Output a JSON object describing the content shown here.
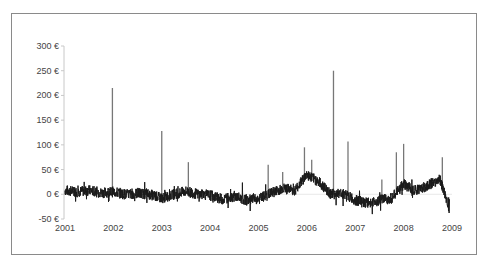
{
  "chart_data": {
    "type": "line",
    "title": "",
    "xlabel": "",
    "ylabel": "",
    "currency_suffix": " €",
    "ylim": [
      -50,
      300
    ],
    "yticks": [
      -50,
      0,
      50,
      100,
      150,
      200,
      250,
      300
    ],
    "ytick_labels": [
      "-50 €",
      "0 €",
      "50 €",
      "100 €",
      "150 €",
      "200 €",
      "250 €",
      "300 €"
    ],
    "xlim": [
      2001,
      2009
    ],
    "xticks": [
      2001,
      2002,
      2003,
      2004,
      2005,
      2006,
      2007,
      2008,
      2009
    ],
    "xtick_labels": [
      "2001",
      "2002",
      "2003",
      "2004",
      "2005",
      "2006",
      "2007",
      "2008",
      "2009"
    ],
    "grid": false,
    "legend": null,
    "line_color": "#1a1a1a",
    "spike_color": "#777777",
    "series": [
      {
        "name": "price",
        "baseline": [
          [
            2001.0,
            8
          ],
          [
            2001.25,
            5
          ],
          [
            2001.5,
            8
          ],
          [
            2001.75,
            3
          ],
          [
            2002.0,
            5
          ],
          [
            2002.25,
            0
          ],
          [
            2002.5,
            2
          ],
          [
            2002.75,
            0
          ],
          [
            2003.0,
            -8
          ],
          [
            2003.25,
            0
          ],
          [
            2003.5,
            6
          ],
          [
            2003.75,
            0
          ],
          [
            2004.0,
            -2
          ],
          [
            2004.25,
            -10
          ],
          [
            2004.5,
            -4
          ],
          [
            2004.75,
            -12
          ],
          [
            2005.0,
            -10
          ],
          [
            2005.25,
            2
          ],
          [
            2005.5,
            12
          ],
          [
            2005.75,
            8
          ],
          [
            2006.0,
            40
          ],
          [
            2006.25,
            25
          ],
          [
            2006.5,
            0
          ],
          [
            2006.75,
            2
          ],
          [
            2007.0,
            -12
          ],
          [
            2007.25,
            -18
          ],
          [
            2007.5,
            -12
          ],
          [
            2007.75,
            -8
          ],
          [
            2008.0,
            20
          ],
          [
            2008.25,
            8
          ],
          [
            2008.5,
            18
          ],
          [
            2008.75,
            30
          ],
          [
            2008.95,
            -30
          ]
        ],
        "spikes": [
          {
            "x": 2001.98,
            "y": 215
          },
          {
            "x": 2003.0,
            "y": 128
          },
          {
            "x": 2003.55,
            "y": 65
          },
          {
            "x": 2005.2,
            "y": 60
          },
          {
            "x": 2005.5,
            "y": 45
          },
          {
            "x": 2005.95,
            "y": 95
          },
          {
            "x": 2006.1,
            "y": 70
          },
          {
            "x": 2006.55,
            "y": 250
          },
          {
            "x": 2006.85,
            "y": 107
          },
          {
            "x": 2007.55,
            "y": 30
          },
          {
            "x": 2007.85,
            "y": 85
          },
          {
            "x": 2008.0,
            "y": 102
          },
          {
            "x": 2008.8,
            "y": 75
          }
        ]
      }
    ]
  }
}
